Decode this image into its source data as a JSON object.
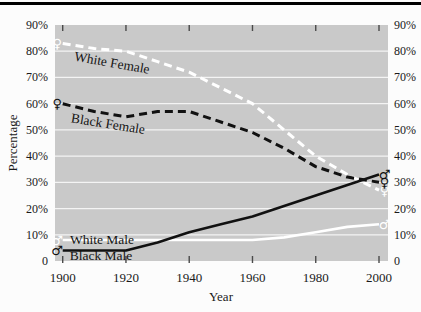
{
  "figure": {
    "background": "#fcfcfc",
    "top_rule_color": "#000000"
  },
  "chart_data": {
    "type": "line",
    "title": "",
    "xlabel": "Year",
    "ylabel": "Percentage",
    "x": [
      1900,
      1910,
      1920,
      1930,
      1940,
      1950,
      1960,
      1970,
      1980,
      1990,
      2000
    ],
    "series": [
      {
        "name": "White Female",
        "color": "#ffffff",
        "style": "dashed",
        "marker": "female",
        "values": [
          83,
          81,
          80,
          76,
          72,
          66,
          60,
          50,
          40,
          33,
          27
        ]
      },
      {
        "name": "Black Female",
        "color": "#111111",
        "style": "dashed",
        "marker": "female",
        "values": [
          60,
          57,
          55,
          57,
          57,
          53,
          49,
          43,
          36,
          32,
          30
        ]
      },
      {
        "name": "White Male",
        "color": "#ffffff",
        "style": "solid",
        "marker": "male",
        "values": [
          8,
          8,
          8,
          8,
          8,
          8,
          8,
          9,
          11,
          13,
          14
        ]
      },
      {
        "name": "Black Male",
        "color": "#111111",
        "style": "solid",
        "marker": "male",
        "values": [
          4,
          4,
          4,
          7,
          11,
          14,
          17,
          21,
          25,
          29,
          33
        ]
      }
    ],
    "xtick_values": [
      1900,
      1920,
      1940,
      1960,
      1980,
      2000
    ],
    "xtick_labels": [
      "1900",
      "1920",
      "1940",
      "1960",
      "1980",
      "2000"
    ],
    "ytick_values": [
      0,
      10,
      20,
      30,
      40,
      50,
      60,
      70,
      80,
      90
    ],
    "ytick_labels": [
      "0",
      "10%",
      "20%",
      "30%",
      "40%",
      "50%",
      "60%",
      "70%",
      "80%",
      "90%"
    ],
    "ylim": [
      0,
      90
    ],
    "xlim": [
      1897.5,
      2003
    ],
    "grid": "horizontal",
    "y_axis_labels_position": "both-sides",
    "plot_bg": "#c9c9c9",
    "grid_color": "rgba(255,255,255,0.8)",
    "tick_color": "#4a4a4a",
    "marker_glyphs": {
      "female": "♀",
      "male": "♂"
    }
  },
  "annotations": [
    {
      "text": "White Female",
      "x": 112,
      "y": 63,
      "rotate": 10
    },
    {
      "text": "Black Female",
      "x": 108,
      "y": 124,
      "rotate": 9
    },
    {
      "text": "White Male",
      "x": 102,
      "y": 240,
      "rotate": 0
    },
    {
      "text": "Black Male",
      "x": 101,
      "y": 256,
      "rotate": 0
    }
  ]
}
